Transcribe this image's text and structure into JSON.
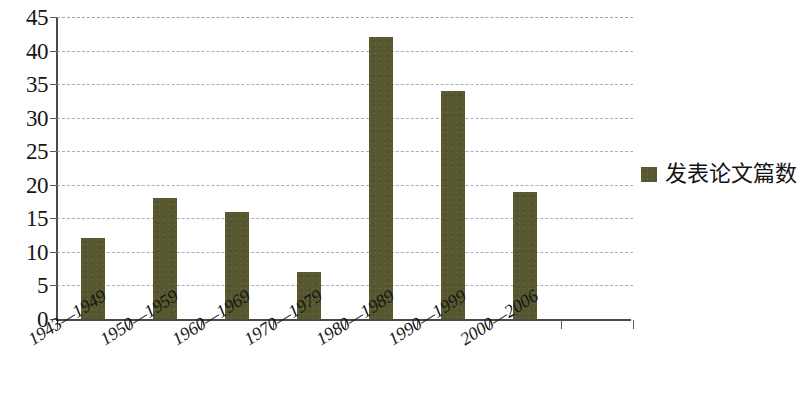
{
  "chart_data": {
    "type": "bar",
    "title": "",
    "xlabel": "",
    "ylabel": "",
    "categories": [
      "1943—1949",
      "1950—1959",
      "1960—1969",
      "1970—1979",
      "1980—1989",
      "1990—1999",
      "2000—2006"
    ],
    "values": [
      12,
      18,
      16,
      7,
      42,
      34,
      19
    ],
    "series": [
      {
        "name": "发表论文篇数",
        "values": [
          12,
          18,
          16,
          7,
          42,
          34,
          19
        ],
        "color": "#585830"
      }
    ],
    "ylim": [
      0,
      45
    ],
    "ytick_step": 5,
    "yticks": [
      45,
      40,
      35,
      30,
      25,
      20,
      15,
      10,
      5,
      0
    ],
    "ytick_labels": [
      "45",
      "40",
      "35",
      "30",
      "25",
      "20",
      "15",
      "10",
      "5",
      "0"
    ],
    "grid": "horizontal-dashed",
    "legend_position": "right",
    "empty_trailing_slot": true,
    "slot_count": 8
  },
  "legend": {
    "label": "发表论文篇数",
    "swatch_color": "#585830"
  },
  "axis": {
    "line_color": "#4a4a4a",
    "grid_color": "#9aa0ae"
  }
}
